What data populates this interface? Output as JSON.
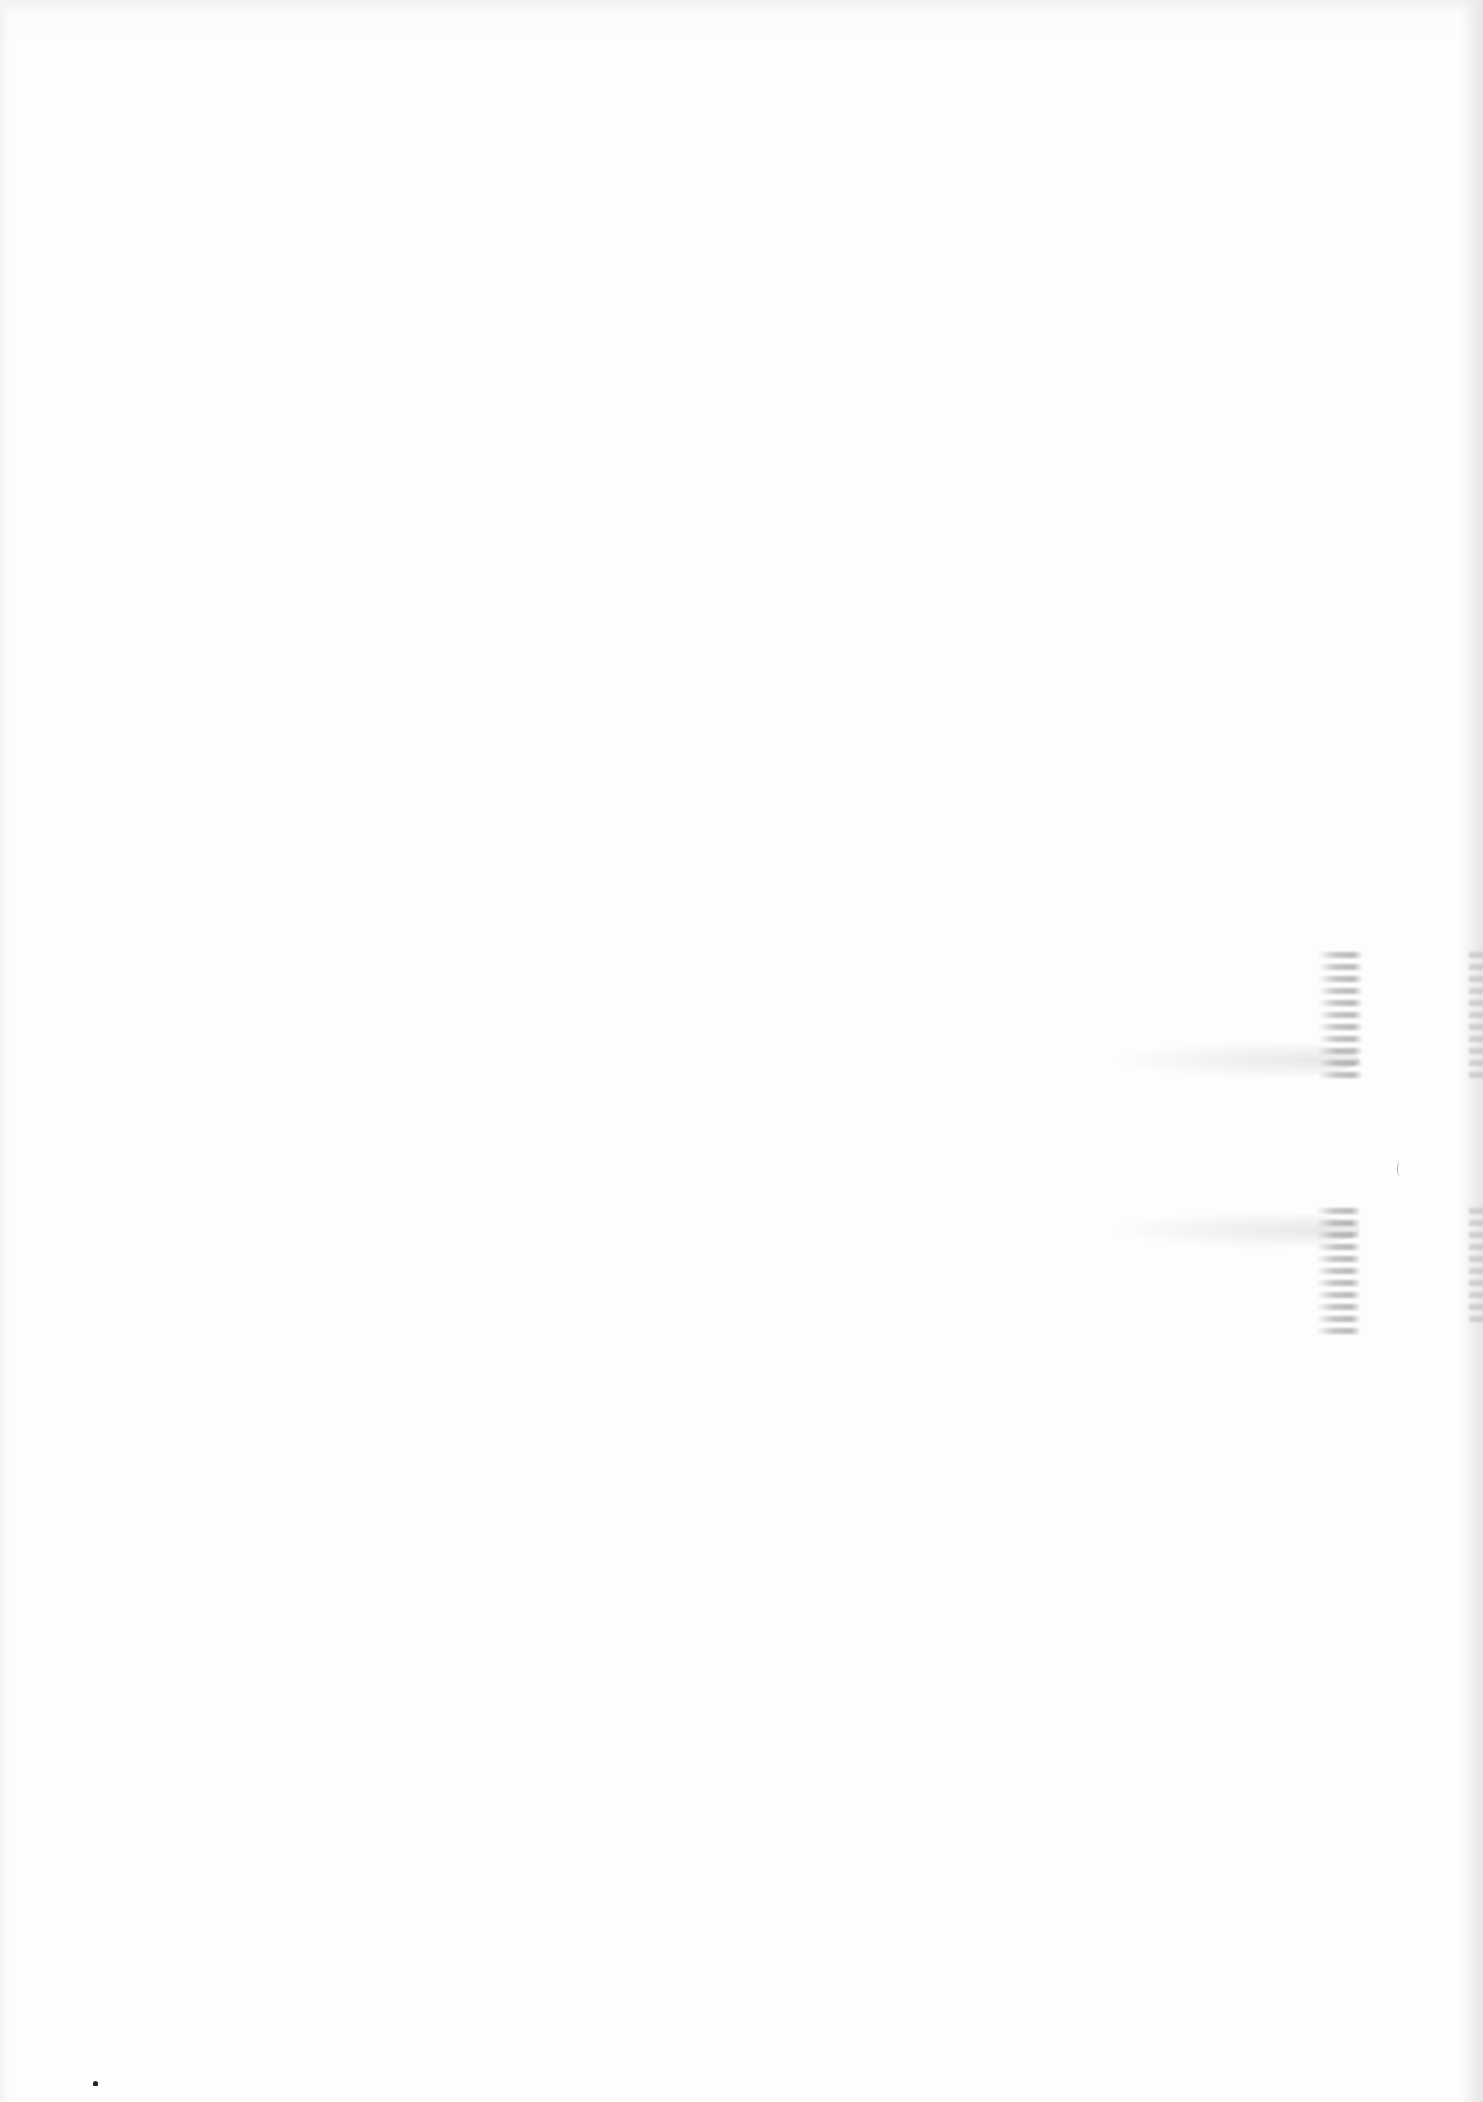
{
  "page": {
    "type": "blank-scanned-page",
    "text_content": [],
    "background_color": "#fdfdfd"
  }
}
